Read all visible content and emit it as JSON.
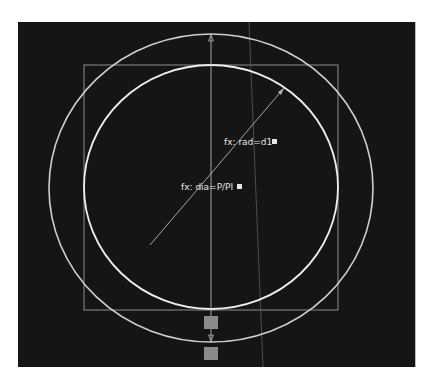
{
  "app": {
    "view": "sketch-viewport"
  },
  "canvas": {
    "background": "#151515",
    "line_color": "#d8d8d8",
    "construction_color": "#7a7a7a"
  },
  "annotations": {
    "radius_label": "fx: rad=d1",
    "diameter_label": "fx: dia=P/PI"
  },
  "geometry": {
    "square": {
      "left": 84,
      "top": 65,
      "right": 338,
      "bottom": 310
    },
    "inner_circle": {
      "cx": 211,
      "cy": 187,
      "rx": 127,
      "ry": 122
    },
    "outer_circle": {
      "cx": 211,
      "cy": 188,
      "rx": 162,
      "ry": 154
    },
    "center_line_x": 211
  },
  "handles": [
    {
      "name": "handle-upper",
      "x": 211,
      "y": 323
    },
    {
      "name": "handle-lower",
      "x": 211,
      "y": 354
    }
  ]
}
